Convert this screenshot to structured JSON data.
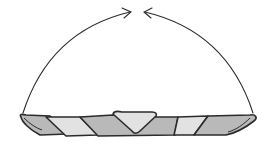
{
  "diagram": {
    "title": "Twisted strip with ends joined into a ring",
    "colors": {
      "outline": "#2b2b2b",
      "dark_face": "#b9b9b9",
      "light_face": "#e2e2e2",
      "background": "#ffffff"
    },
    "elements": [
      {
        "id": "left-arc-arrow",
        "kind": "arrow",
        "direction": "left end up and over to center"
      },
      {
        "id": "right-arc-arrow",
        "kind": "arrow",
        "direction": "right end up and over to center"
      },
      {
        "id": "twisted-strip",
        "kind": "shape",
        "segments": 7
      }
    ]
  }
}
